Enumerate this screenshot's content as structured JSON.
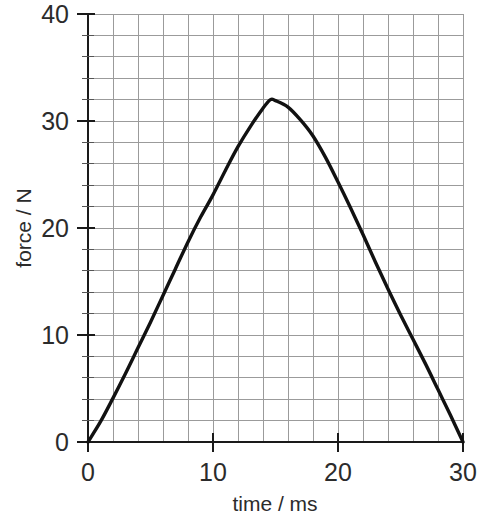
{
  "chart_data": {
    "type": "line",
    "title": "",
    "subtitle": "",
    "xlabel": "time / ms",
    "ylabel": "force / N",
    "xlim": [
      0,
      30
    ],
    "ylim": [
      0,
      40
    ],
    "x_ticks": [
      0,
      10,
      20,
      30
    ],
    "x_tick_labels": [
      "0",
      "10",
      "20",
      "30"
    ],
    "y_ticks": [
      0,
      10,
      20,
      30,
      40
    ],
    "y_tick_labels": [
      "0",
      "10",
      "20",
      "30",
      "40"
    ],
    "x_minor_step": 2,
    "y_minor_step": 2,
    "grid": true,
    "grid_color": "#9b9b9b",
    "legend": null,
    "annotations": [],
    "series": [
      {
        "name": "force",
        "color": "#111111",
        "x": [
          0,
          1,
          2,
          3,
          4,
          5,
          6,
          7,
          8,
          9,
          10,
          11,
          12,
          13,
          14,
          14.6,
          15,
          16,
          17,
          18,
          19,
          20,
          21,
          22,
          23,
          24,
          25,
          26,
          27,
          28,
          29,
          30
        ],
        "y": [
          0,
          1.9,
          4.1,
          6.4,
          8.8,
          11.2,
          13.7,
          16.2,
          18.7,
          21.0,
          23.1,
          25.4,
          27.6,
          29.5,
          31.2,
          32.0,
          31.9,
          31.3,
          30.1,
          28.6,
          26.6,
          24.3,
          21.9,
          19.4,
          16.8,
          14.3,
          11.9,
          9.6,
          7.3,
          4.9,
          2.5,
          0
        ]
      }
    ],
    "peak": {
      "x": 14.6,
      "y": 32.0,
      "label": ""
    }
  },
  "axis_labels": {
    "x_title": "time / ms",
    "y_title": "force / N"
  },
  "x_tick_labels": {
    "t0": "0",
    "t1": "10",
    "t2": "20",
    "t3": "30"
  },
  "y_tick_labels": {
    "f0": "0",
    "f1": "10",
    "f2": "20",
    "f3": "30",
    "f4": "40"
  }
}
